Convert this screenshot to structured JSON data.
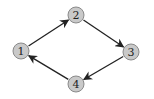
{
  "diagram": {
    "type": "directed-cycle-graph",
    "colors": {
      "node_fill": "#c9c9c9",
      "node_stroke": "#8a8a8a",
      "edge": "#222222",
      "background": "#ffffff"
    },
    "nodes": [
      {
        "id": "1",
        "label": "1",
        "x": 21,
        "y": 51
      },
      {
        "id": "2",
        "label": "2",
        "x": 76,
        "y": 15
      },
      {
        "id": "3",
        "label": "3",
        "x": 131,
        "y": 52
      },
      {
        "id": "4",
        "label": "4",
        "x": 76,
        "y": 84
      }
    ],
    "edges": [
      {
        "from": "1",
        "to": "2"
      },
      {
        "from": "2",
        "to": "3"
      },
      {
        "from": "3",
        "to": "4"
      },
      {
        "from": "4",
        "to": "1"
      }
    ]
  }
}
